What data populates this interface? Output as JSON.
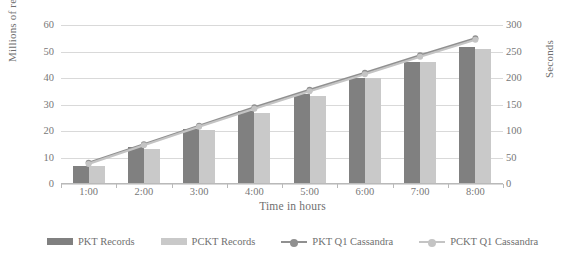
{
  "chart_data": {
    "type": "bar",
    "title": "",
    "subtitle": "",
    "xlabel": "Time in hours",
    "ylabel": "Millions of records",
    "y2label": "Seconds",
    "categories": [
      "1:00",
      "2:00",
      "3:00",
      "4:00",
      "5:00",
      "6:00",
      "7:00",
      "8:00"
    ],
    "ylim": [
      0,
      60
    ],
    "y2lim": [
      0,
      300
    ],
    "yticks": [
      0,
      10,
      20,
      30,
      40,
      50,
      60
    ],
    "y2ticks": [
      0,
      50,
      100,
      150,
      200,
      250,
      300
    ],
    "grid": true,
    "legend_position": "bottom",
    "series": [
      {
        "name": "PKT Records",
        "kind": "bar",
        "axis": "left",
        "color": "#808080",
        "values": [
          6.5,
          13.5,
          20.5,
          27,
          33.5,
          39.5,
          45.5,
          51.5
        ]
      },
      {
        "name": "PCKT Records",
        "kind": "bar",
        "axis": "left",
        "color": "#c9c9c9",
        "values": [
          6.5,
          13,
          20,
          26.5,
          33,
          39.5,
          45.5,
          50.5
        ]
      },
      {
        "name": "PKT Q1 Cassandra",
        "kind": "line",
        "axis": "right",
        "color": "#909090",
        "values": [
          40,
          75,
          110,
          145,
          178,
          210,
          243,
          275
        ]
      },
      {
        "name": "PCKT Q1 Cassandra",
        "kind": "line",
        "axis": "right",
        "color": "#c4c4c4",
        "values": [
          38,
          73,
          108,
          142,
          175,
          207,
          240,
          272
        ]
      }
    ]
  },
  "axes": {
    "left_title": "Millions of records",
    "right_title": "Seconds",
    "bottom_title": "Time in hours",
    "left_ticks": [
      "0",
      "10",
      "20",
      "30",
      "40",
      "50",
      "60"
    ],
    "right_ticks": [
      "0",
      "50",
      "100",
      "150",
      "200",
      "250",
      "300"
    ],
    "bottom_ticks": [
      "1:00",
      "2:00",
      "3:00",
      "4:00",
      "5:00",
      "6:00",
      "7:00",
      "8:00"
    ]
  },
  "legend": {
    "items": [
      {
        "label": "PKT Records",
        "type": "bar",
        "color": "#808080"
      },
      {
        "label": "PCKT Records",
        "type": "bar",
        "color": "#c9c9c9"
      },
      {
        "label": "PKT Q1 Cassandra",
        "type": "line",
        "color": "#909090"
      },
      {
        "label": "PCKT Q1 Cassandra",
        "type": "line",
        "color": "#c4c4c4"
      }
    ]
  }
}
